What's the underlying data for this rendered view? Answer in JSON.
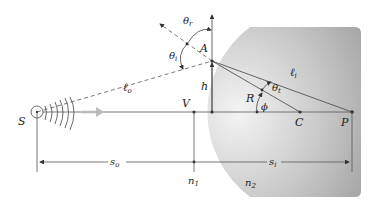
{
  "diagram": {
    "type": "refraction at a spherical surface",
    "points": {
      "source": "S",
      "vertex": "V",
      "incidence_point": "A",
      "center": "C",
      "image": "P"
    },
    "labels": {
      "theta_r": "θ",
      "theta_r_sub": "r",
      "theta_i": "θ",
      "theta_i_sub": "i",
      "theta_t": "θ",
      "theta_t_sub": "t",
      "l_o": "ℓ",
      "l_o_sub": "o",
      "l_i": "ℓ",
      "l_i_sub": "i",
      "h": "h",
      "R": "R",
      "phi": "ϕ",
      "s_o": "s",
      "s_o_sub": "o",
      "s_i": "s",
      "s_i_sub": "i",
      "n1": "n",
      "n1_sub": "1",
      "n2": "n",
      "n2_sub": "2"
    },
    "colors": {
      "medium_light": "#f2f2f2",
      "medium_dark": "#9a9a9a",
      "line": "#555555",
      "arrow_gray": "#b8b8b8"
    }
  }
}
